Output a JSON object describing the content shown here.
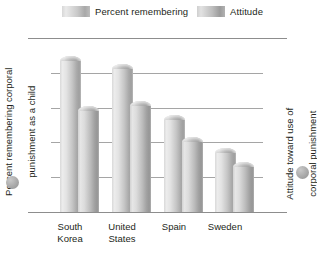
{
  "chart_data": {
    "type": "bar",
    "title": "",
    "categories": [
      "South Korea",
      "United States",
      "Spain",
      "Sweden"
    ],
    "series": [
      {
        "name": "Percent remembering",
        "axis": "left",
        "values": [
          87,
          82,
          53,
          34
        ]
      },
      {
        "name": "Attitude",
        "axis": "right",
        "values": [
          2.9,
          3.05,
          2.0,
          1.3
        ]
      }
    ],
    "xlabel": "",
    "ylabel": "Percent remembering corporal punishment as a child",
    "y2label": "Attitude toward use of corporal punishment",
    "ylim": [
      0,
      100
    ],
    "y2lim": [
      0,
      5
    ],
    "yticks": [
      "0",
      "20",
      "40",
      "60",
      "80",
      "100"
    ],
    "y2ticks": [
      "0",
      "1",
      "2",
      "3",
      "4",
      "5"
    ],
    "grid": true,
    "legend_position": "top"
  },
  "legend": {
    "percent_label": "Percent remembering",
    "attitude_label": "Attitude"
  },
  "axes": {
    "left_title_line1": "Percent remembering corporal",
    "left_title_line2": "punishment as a child",
    "right_title_line1": "Attitude toward use of",
    "right_title_line2": "corporal punishment",
    "left_ticks": [
      "100",
      "80",
      "60",
      "40",
      "20",
      "0"
    ],
    "right_ticks": [
      "5",
      "4",
      "3",
      "2",
      "1",
      "0"
    ]
  },
  "categories": {
    "c0_line1": "South",
    "c0_line2": "Korea",
    "c1_line1": "United",
    "c1_line2": "States",
    "c2_line1": "Spain",
    "c2_line2": "",
    "c3_line1": "Sweden",
    "c3_line2": ""
  },
  "colors": {
    "bar_light": "#ececec",
    "bar_mid": "#c6c6c6",
    "bar_dark": "#9f9f9f",
    "gridline": "#a5a5a5",
    "text": "#231f20",
    "background": "#ffffff"
  }
}
